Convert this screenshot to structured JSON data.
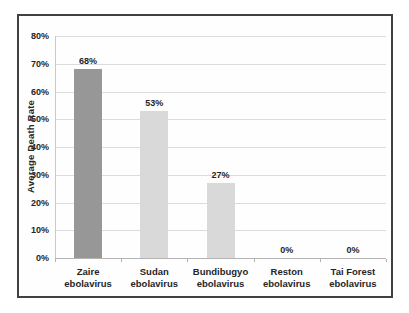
{
  "chart_data": {
    "type": "bar",
    "title": "",
    "xlabel": "",
    "ylabel": "Average Death Rate",
    "categories": [
      "Zaire ebolavirus",
      "Sudan ebolavirus",
      "Bundibugyo ebolavirus",
      "Reston ebolavirus",
      "Tai Forest ebolavirus"
    ],
    "category_lines": [
      [
        "Zaire",
        "ebolavirus"
      ],
      [
        "Sudan",
        "ebolavirus"
      ],
      [
        "Bundibugyo",
        "ebolavirus"
      ],
      [
        "Reston",
        "ebolavirus"
      ],
      [
        "Tai Forest",
        "ebolavirus"
      ]
    ],
    "values": [
      68,
      53,
      27,
      0,
      0
    ],
    "data_labels": [
      "68%",
      "53%",
      "27%",
      "0%",
      "0%"
    ],
    "bar_colors": [
      "#979797",
      "#d9d9d9",
      "#d9d9d9",
      "#d9d9d9",
      "#d9d9d9"
    ],
    "ylim": [
      0,
      80
    ],
    "ytick_step": 10,
    "ytick_labels": [
      "0%",
      "10%",
      "20%",
      "30%",
      "40%",
      "50%",
      "60%",
      "70%",
      "80%"
    ],
    "grid": "horizontal",
    "legend": "none"
  },
  "colors": {
    "background": "#ffffff",
    "frame_border": "#414141",
    "gridline": "#dcdcdc",
    "axis_line": "#b3b3b3",
    "text": "#262626",
    "bar_dark": "#979797",
    "bar_light": "#d9d9d9"
  }
}
